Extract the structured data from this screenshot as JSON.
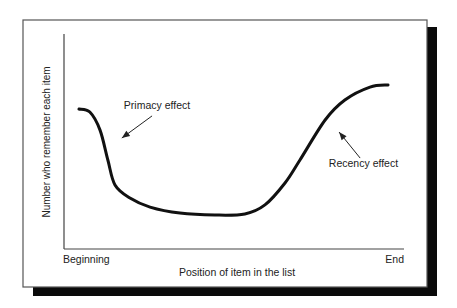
{
  "chart_data": {
    "type": "line",
    "title": "",
    "xlabel": "Position of item in the list",
    "ylabel": "Number who remember each item",
    "x_tick_labels": {
      "start": "Beginning",
      "end": "End"
    },
    "xlim": [
      0,
      1
    ],
    "ylim": [
      0,
      1
    ],
    "grid": false,
    "legend": "none",
    "series": [
      {
        "name": "Serial position curve",
        "x": [
          0.044,
          0.076,
          0.106,
          0.129,
          0.15,
          0.194,
          0.253,
          0.341,
          0.444,
          0.532,
          0.591,
          0.65,
          0.694,
          0.768,
          0.826,
          0.9,
          0.953
        ],
        "y": [
          0.651,
          0.637,
          0.553,
          0.414,
          0.298,
          0.237,
          0.195,
          0.167,
          0.158,
          0.163,
          0.205,
          0.307,
          0.414,
          0.6,
          0.693,
          0.753,
          0.763
        ]
      }
    ],
    "annotations": [
      {
        "text": "Primacy effect",
        "label_at": [
          0.176,
          0.65
        ],
        "arrow_from": [
          0.259,
          0.619
        ],
        "arrow_to": [
          0.17,
          0.516
        ]
      },
      {
        "text": "Recency effect",
        "label_at": [
          0.779,
          0.381
        ],
        "arrow_from": [
          0.871,
          0.423
        ],
        "arrow_to": [
          0.809,
          0.544
        ]
      }
    ]
  },
  "colors": {
    "curve": "#111111",
    "axis": "#444444",
    "frame": "#555555",
    "shadow": "#0a0a0a",
    "text": "#222222"
  }
}
